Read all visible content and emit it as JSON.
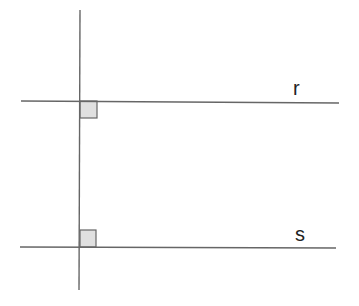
{
  "diagram": {
    "title": "",
    "lines": {
      "transversal": {
        "x1": 80,
        "y1": 10,
        "x2": 79,
        "y2": 290,
        "color": "#666666"
      },
      "r": {
        "x1": 21,
        "y1": 101,
        "x2": 339,
        "y2": 103,
        "color": "#666666",
        "label": "r"
      },
      "s": {
        "x1": 20,
        "y1": 247,
        "x2": 336,
        "y2": 248,
        "color": "#666666",
        "label": "s"
      }
    },
    "right_angle_markers": [
      {
        "x": 80,
        "y": 101,
        "w": 17,
        "h": 17,
        "fill": "#e0e0e0",
        "stroke": "#666666"
      },
      {
        "x": 80,
        "y": 230,
        "w": 16,
        "h": 17,
        "fill": "#e0e0e0",
        "stroke": "#666666"
      }
    ],
    "labels": {
      "r": "r",
      "s": "s"
    }
  }
}
